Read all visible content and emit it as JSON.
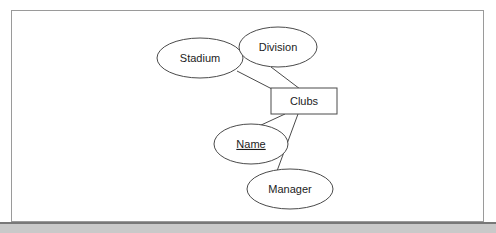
{
  "document": {
    "title": "Clubs ER Diagram",
    "page_background": "#ffffff",
    "frame_border_color": "#9a9a9a",
    "bottom_band_color": "#c9c9c9",
    "bottom_band_top_line_color": "#787878",
    "line_color": "#4a4a4a",
    "text_color": "#1c1c1c"
  },
  "diagram": {
    "type": "entity-relationship",
    "entities": [
      {
        "id": "clubs",
        "label": "Clubs",
        "shape": "rectangle",
        "role": "entity",
        "x": 271,
        "y": 88,
        "width": 66,
        "height": 26,
        "cx": 304,
        "cy": 101
      }
    ],
    "attributes": [
      {
        "id": "stadium",
        "label": "Stadium",
        "shape": "ellipse",
        "role": "attribute",
        "key": false,
        "cx": 200,
        "cy": 58,
        "rx": 43,
        "ry": 20
      },
      {
        "id": "division",
        "label": "Division",
        "shape": "ellipse",
        "role": "attribute",
        "key": false,
        "cx": 278,
        "cy": 47,
        "rx": 39,
        "ry": 20
      },
      {
        "id": "name",
        "label": "Name",
        "shape": "ellipse",
        "role": "attribute",
        "key": true,
        "cx": 251,
        "cy": 144,
        "rx": 37,
        "ry": 20
      },
      {
        "id": "manager",
        "label": "Manager",
        "shape": "ellipse",
        "role": "attribute",
        "key": false,
        "cx": 290,
        "cy": 189,
        "rx": 43,
        "ry": 20
      }
    ],
    "connectors": [
      {
        "id": "stadium-clubs",
        "from": "stadium",
        "to": "clubs",
        "x1": 237,
        "y1": 71,
        "x2": 272,
        "y2": 89
      },
      {
        "id": "division-clubs",
        "from": "division",
        "to": "clubs",
        "x1": 271,
        "y1": 67,
        "x2": 300,
        "y2": 89
      },
      {
        "id": "clubs-name",
        "from": "clubs",
        "to": "name",
        "x1": 285,
        "y1": 114,
        "x2": 259,
        "y2": 126
      },
      {
        "id": "clubs-manager",
        "from": "clubs",
        "to": "manager",
        "x1": 298,
        "y1": 114,
        "x2": 277,
        "y2": 171
      }
    ]
  }
}
